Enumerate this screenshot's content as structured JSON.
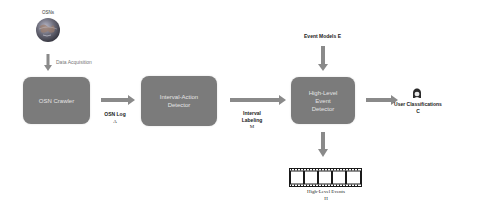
{
  "diagram": {
    "source": {
      "label": "OSNs",
      "icon": "globe-icon"
    },
    "data_acquisition": {
      "label": "Data Acquisition"
    },
    "nodes": [
      {
        "id": "osn-crawler",
        "label": "OSN Crawler"
      },
      {
        "id": "interval-action-detector",
        "line1": "Interval-Action",
        "line2": "Detector"
      },
      {
        "id": "high-level-event-detector",
        "line1": "High-Level",
        "line2": "Event",
        "line3": "Detector"
      }
    ],
    "edges": {
      "osn_log": {
        "line1": "OSN Log",
        "line2": "A"
      },
      "interval_labeling": {
        "line1": "Interval",
        "line2": "Labeling",
        "line3": "M"
      },
      "event_models": {
        "label": "Event Models E"
      },
      "user_classifications": {
        "line1": "User Classifications",
        "line2": "C",
        "icon": "user-icon"
      },
      "high_level_events": {
        "line1": "High-Level Events",
        "line2": "H",
        "icon": "film-strip-icon"
      }
    },
    "colors": {
      "box_fill": "#7b7b7b",
      "box_text": "#e4e4e4",
      "arrow": "#8a8a8a"
    }
  }
}
